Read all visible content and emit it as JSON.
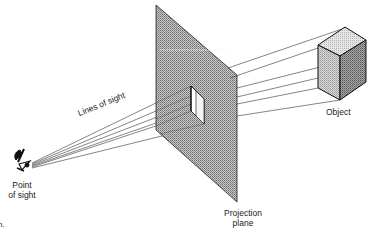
{
  "diagram": {
    "type": "perspective projection illustration",
    "labels": {
      "lines_of_sight": "Lines of sight",
      "object": "Object",
      "point_of_sight_line1": "Point",
      "point_of_sight_line2": "of sight",
      "projection_plane_line1": "Projection",
      "projection_plane_line2": "plane",
      "edge_fragment": "n."
    },
    "colors": {
      "plane_fill": "#a9a9a9",
      "cube_top": "#d8d8d8",
      "cube_left": "#c2c2c2",
      "cube_right": "#8f8f8f",
      "line": "#333333"
    }
  }
}
